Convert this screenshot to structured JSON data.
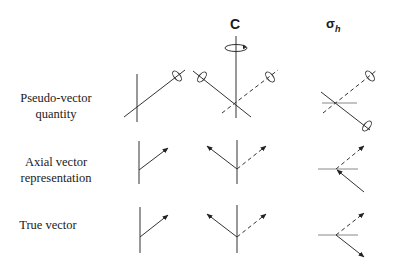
{
  "columns": {
    "c": {
      "label": "C"
    },
    "sigma_h": {
      "symbol": "σ",
      "subscript": "h"
    }
  },
  "rows": [
    {
      "id": "pseudo-vector",
      "line1": "Pseudo-vector",
      "line2": "quantity"
    },
    {
      "id": "axial-vector",
      "line1": "Axial vector",
      "line2": "representation"
    },
    {
      "id": "true-vector",
      "line1": "True vector",
      "line2": ""
    }
  ],
  "colors": {
    "line": "#333333",
    "dashed": "#555555",
    "background": "#ffffff"
  }
}
